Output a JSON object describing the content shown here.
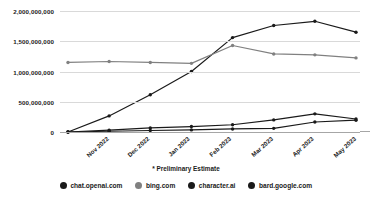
{
  "chart_data": {
    "type": "line",
    "title": "",
    "xlabel": "",
    "ylabel": "",
    "categories": [
      "Nov 2022",
      "Dec 2022",
      "Jan 2023",
      "Feb 2023",
      "Mar 2023",
      "Apr 2023",
      "May 2023",
      "Jun 2023*"
    ],
    "ylim": [
      0,
      2000000000
    ],
    "ytick_values": [
      0,
      500000000,
      1000000000,
      1500000000,
      2000000000
    ],
    "ytick_labels": [
      "0",
      "500,000,000",
      "1,000,000,000",
      "1,500,000,000",
      "2,000,000,000"
    ],
    "grid": true,
    "legend_position": "bottom",
    "annotation": "* Preliminary Estimate",
    "series": [
      {
        "name": "chat.openai.com",
        "color": "#1a1a1a",
        "marker": "circle",
        "values": [
          0,
          266000000,
          616000000,
          1000000000,
          1560000000,
          1760000000,
          1830000000,
          1650000000
        ]
      },
      {
        "name": "bing.com",
        "color": "#808080",
        "marker": "circle",
        "values": [
          1150000000,
          1165000000,
          1150000000,
          1135000000,
          1430000000,
          1290000000,
          1275000000,
          1225000000
        ]
      },
      {
        "name": "character.ai",
        "color": "#1a1a1a",
        "marker": "circle",
        "values": [
          0,
          30000000,
          68000000,
          90000000,
          120000000,
          200000000,
          300000000,
          215000000
        ]
      },
      {
        "name": "bard.google.com",
        "color": "#1a1a1a",
        "marker": "circle",
        "values": [
          0,
          12000000,
          25000000,
          35000000,
          50000000,
          60000000,
          165000000,
          195000000
        ]
      }
    ]
  },
  "legend": {
    "items": [
      {
        "label": "chat.openai.com",
        "color": "#1a1a1a"
      },
      {
        "label": "bing.com",
        "color": "#808080"
      },
      {
        "label": "character.ai",
        "color": "#1a1a1a"
      },
      {
        "label": "bard.google.com",
        "color": "#1a1a1a"
      }
    ]
  },
  "footnote": {
    "text": "* Preliminary Estimate"
  }
}
